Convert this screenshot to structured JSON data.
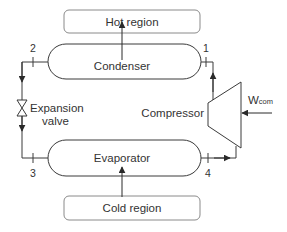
{
  "diagram": {
    "type": "vapor-compression refrigeration cycle",
    "components": {
      "hot_region": "Hot region",
      "condenser": "Condenser",
      "expansion_valve_line1": "Expansion",
      "expansion_valve_line2": "valve",
      "compressor": "Compressor",
      "evaporator": "Evaporator",
      "cold_region": "Cold region"
    },
    "work_input": {
      "symbol": "W",
      "subscript": "com"
    },
    "state_points": [
      "1",
      "2",
      "3",
      "4"
    ],
    "colors": {
      "line": "#3a3a3a",
      "text": "#333333",
      "box_border": "#8a8a8a",
      "background": "#ffffff"
    }
  }
}
